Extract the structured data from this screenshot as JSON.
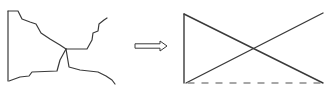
{
  "diagram": {
    "stroke_color": "#3a3a3a",
    "dash_color": "#8a8a8a",
    "left_figure": {
      "name": "irregular-figure",
      "left_edge": [
        [
          8,
          11
        ],
        [
          8,
          81
        ]
      ],
      "top_path": [
        [
          8,
          11
        ],
        [
          18,
          11
        ],
        [
          22,
          19
        ],
        [
          30,
          22
        ],
        [
          36,
          24
        ],
        [
          41,
          33
        ],
        [
          50,
          39
        ],
        [
          60,
          45
        ],
        [
          66,
          49
        ]
      ],
      "right_upper_path": [
        [
          66,
          49
        ],
        [
          87,
          49
        ],
        [
          92,
          40
        ],
        [
          93,
          33
        ],
        [
          98,
          31
        ],
        [
          99,
          24
        ],
        [
          104,
          20
        ],
        [
          107,
          18
        ]
      ],
      "bottom_path": [
        [
          9,
          81
        ],
        [
          20,
          77
        ],
        [
          29,
          76
        ],
        [
          32,
          72
        ],
        [
          57,
          71
        ],
        [
          60,
          60
        ],
        [
          66,
          49
        ]
      ],
      "right_lower_path": [
        [
          66,
          49
        ],
        [
          69,
          67
        ],
        [
          80,
          70
        ],
        [
          98,
          72
        ],
        [
          106,
          76
        ],
        [
          112,
          80
        ],
        [
          115,
          84
        ]
      ]
    },
    "arrow": {
      "name": "transform-arrow",
      "direction": "right",
      "from": [
        135,
        46
      ],
      "to": [
        167,
        46
      ]
    },
    "right_figure": {
      "name": "simplified-figure",
      "vertical_edge": [
        [
          184,
          14
        ],
        [
          184,
          83
        ]
      ],
      "diagonal_down": [
        [
          184,
          14
        ],
        [
          323,
          83
        ]
      ],
      "diagonal_up": [
        [
          186,
          83
        ],
        [
          323,
          13
        ]
      ],
      "dashed_base": [
        [
          188,
          83
        ],
        [
          320,
          83
        ]
      ]
    }
  }
}
